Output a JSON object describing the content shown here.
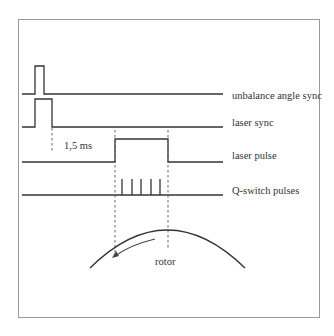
{
  "diagram": {
    "signals": [
      {
        "label": "unbalance angle sync"
      },
      {
        "label": "laser sync"
      },
      {
        "label": "laser pulse"
      },
      {
        "label": "Q-switch pulses"
      }
    ],
    "delay_label": "1,5 ms",
    "rotor_label": "rotor",
    "q_switch_pulse_count": 5,
    "colors": {
      "line": "#333333",
      "frame": "#9a9a9a",
      "background": "#ffffff"
    }
  }
}
